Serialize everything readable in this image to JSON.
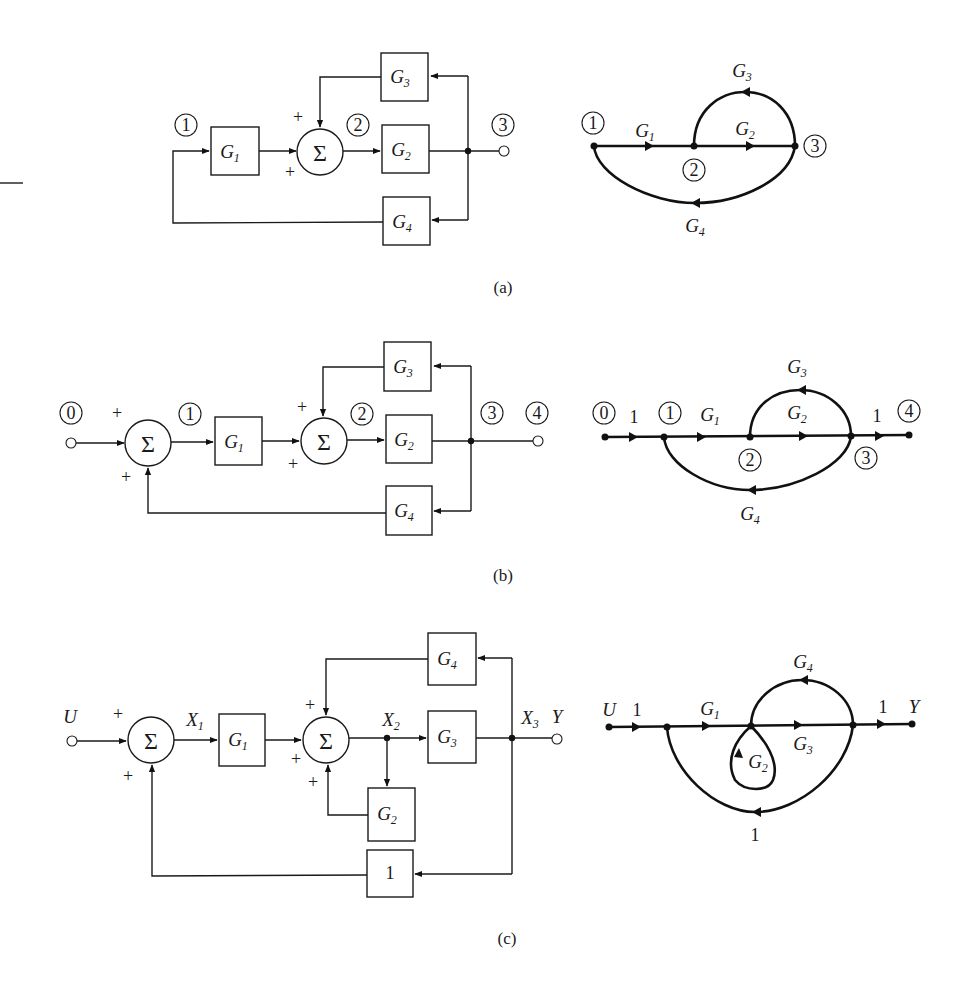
{
  "figure": {
    "captions": {
      "a": "(a)",
      "b": "(b)",
      "c": "(c)"
    },
    "sum_symbol": "Σ",
    "plus": "+",
    "a": {
      "block": {
        "node_labels": [
          "1",
          "2",
          "3"
        ],
        "blocks": {
          "g1": "G",
          "g1_sub": "1",
          "g2": "G",
          "g2_sub": "2",
          "g3": "G",
          "g3_sub": "3",
          "g4": "G",
          "g4_sub": "4"
        }
      },
      "sfg": {
        "node_labels": [
          "1",
          "2",
          "3"
        ],
        "branches": {
          "g1": "G",
          "g1_sub": "1",
          "g2": "G",
          "g2_sub": "2",
          "g3": "G",
          "g3_sub": "3",
          "g4": "G",
          "g4_sub": "4"
        }
      }
    },
    "b": {
      "block": {
        "node_labels": [
          "0",
          "1",
          "2",
          "3",
          "4"
        ],
        "blocks": {
          "g1": "G",
          "g1_sub": "1",
          "g2": "G",
          "g2_sub": "2",
          "g3": "G",
          "g3_sub": "3",
          "g4": "G",
          "g4_sub": "4"
        }
      },
      "sfg": {
        "node_labels": [
          "0",
          "1",
          "2",
          "3",
          "4"
        ],
        "branches": {
          "in_gain": "1",
          "out_gain": "1",
          "g1": "G",
          "g1_sub": "1",
          "g2": "G",
          "g2_sub": "2",
          "g3": "G",
          "g3_sub": "3",
          "g4": "G",
          "g4_sub": "4"
        }
      }
    },
    "c": {
      "block": {
        "signals": {
          "u": "U",
          "x1": "X",
          "x1_sub": "1",
          "x2": "X",
          "x2_sub": "2",
          "x3": "X",
          "x3_sub": "3",
          "y": "Y"
        },
        "blocks": {
          "g1": "G",
          "g1_sub": "1",
          "g2": "G",
          "g2_sub": "2",
          "g3": "G",
          "g3_sub": "3",
          "g4": "G",
          "g4_sub": "4",
          "unity": "1"
        }
      },
      "sfg": {
        "signals": {
          "u": "U",
          "y": "Y"
        },
        "branches": {
          "in_gain": "1",
          "out_gain": "1",
          "fb_gain": "1",
          "g1": "G",
          "g1_sub": "1",
          "g2": "G",
          "g2_sub": "2",
          "g3": "G",
          "g3_sub": "3",
          "g4": "G",
          "g4_sub": "4"
        }
      }
    }
  }
}
